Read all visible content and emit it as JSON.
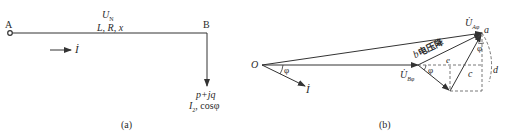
{
  "diagram_a": {
    "node_a_label": "A",
    "node_b_label": "B",
    "voltage_label": "U",
    "voltage_subscript": "N",
    "line_params": "L, R, x",
    "current_label": "İ",
    "load_power": "p+jq",
    "load_current": "I",
    "load_current_subscript": "2",
    "load_pf": ", cosφ",
    "caption": "(a)"
  },
  "diagram_b": {
    "origin_label": "O",
    "angle_label_origin": "φ",
    "current_label": "İ",
    "source_voltage": "U̇",
    "source_voltage_subscript": "Aφ",
    "receiving_voltage": "U̇",
    "receiving_voltage_subscript": "Bφ",
    "point_a": "a",
    "point_b": "b",
    "drop_label": "电压降",
    "angle_label_b": "φ",
    "angle_label_a": "φ",
    "point_e": "e",
    "point_c": "c",
    "point_d": "d",
    "caption": "(b)"
  },
  "colors": {
    "line": "#333333",
    "dashed": "#555555",
    "background": "#ffffff"
  }
}
